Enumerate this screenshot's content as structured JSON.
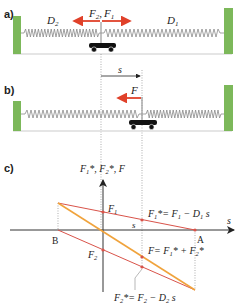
{
  "panel_a": {
    "label": "a)",
    "spring_left_label": "D",
    "spring_left_sub": "2",
    "spring_right_label": "D",
    "spring_right_sub": "1",
    "force_left_label": "F",
    "force_left_sub": "2",
    "force_right_label": "F",
    "force_right_sub": "1",
    "separator": ","
  },
  "displacement": {
    "label": "s"
  },
  "panel_b": {
    "label": "b)",
    "force_label": "F"
  },
  "panel_c": {
    "label": "c)",
    "y_axis_label": "F1*, F2*, F",
    "x_axis_label": "s",
    "point_A": "A",
    "point_B": "B",
    "F1_label": "F",
    "F1_sub": "1",
    "F2_label": "F",
    "F2_sub": "2",
    "s_tick_label": "s",
    "eq_F1_star": "F1* = F1 − D1 s",
    "eq_F1_star_parts": {
      "a": "F",
      "a_sub": "1",
      "b": "*= F",
      "b_sub": "1",
      "c": " − D",
      "c_sub": "1",
      "d": " s"
    },
    "eq_F": "F = F1* + F2*",
    "eq_F_parts": {
      "a": "F= F",
      "a_sub": "1",
      "b": "* + F",
      "b_sub": "2",
      "c": "*"
    },
    "eq_F2_star": "F2* = F2 − D2 s",
    "eq_F2_star_parts": {
      "a": "F",
      "a_sub": "2",
      "b": "*= F",
      "b_sub": "2",
      "c": " − D",
      "c_sub": "2",
      "d": " s"
    },
    "y_axis_parts": {
      "a": "F",
      "a_sub": "1",
      "b": "*, F",
      "b_sub": "2",
      "c": "*, F"
    }
  },
  "colors": {
    "wall_green": "#7cb85a",
    "force_red": "#e0412a",
    "line_red": "#d9534a",
    "line_orange": "#f0a33c",
    "axis": "#333333",
    "spring": "#888888",
    "cart": "#111111",
    "floor": "#dddddd"
  }
}
